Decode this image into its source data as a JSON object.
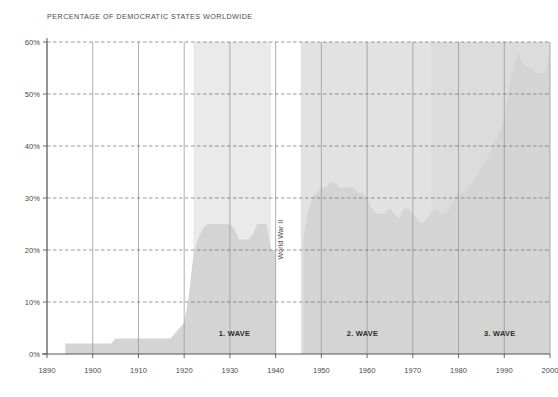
{
  "chart_data": {
    "type": "area",
    "title": "PERCENTAGE OF DEMOCRATIC STATES WORLDWIDE",
    "xlabel": "",
    "ylabel": "",
    "xlim": [
      1890,
      2000
    ],
    "ylim": [
      0,
      60
    ],
    "grid": true,
    "legend": "none",
    "y_ticks": [
      "0%",
      "10%",
      "20%",
      "30%",
      "40%",
      "50%",
      "60%"
    ],
    "y_tick_values": [
      0,
      10,
      20,
      30,
      40,
      50,
      60
    ],
    "x_ticks": [
      "1890",
      "1900",
      "1910",
      "1920",
      "1930",
      "1940",
      "1950",
      "1960",
      "1970",
      "1980",
      "1990",
      "2000"
    ],
    "x_tick_values": [
      1890,
      1900,
      1910,
      1920,
      1930,
      1940,
      1950,
      1960,
      1970,
      1980,
      1990,
      2000
    ],
    "series": [
      {
        "name": "Percentage of democratic states worldwide",
        "fill_color": "#d4d4d4",
        "x": [
          1890,
          1893,
          1894,
          1899,
          1900,
          1904,
          1905,
          1909,
          1910,
          1914,
          1915,
          1917,
          1918,
          1919,
          1920,
          1921,
          1922,
          1923,
          1924,
          1925,
          1926,
          1927,
          1928,
          1929,
          1930,
          1931,
          1932,
          1933,
          1934,
          1935,
          1936,
          1937,
          1938,
          1939,
          1940,
          1941,
          1942,
          1943,
          1944,
          1945,
          1946,
          1947,
          1948,
          1949,
          1950,
          1951,
          1952,
          1953,
          1954,
          1955,
          1956,
          1957,
          1958,
          1959,
          1960,
          1961,
          1962,
          1963,
          1964,
          1965,
          1966,
          1967,
          1968,
          1969,
          1970,
          1971,
          1972,
          1973,
          1974,
          1975,
          1976,
          1977,
          1978,
          1979,
          1980,
          1981,
          1982,
          1983,
          1984,
          1985,
          1986,
          1987,
          1988,
          1989,
          1990,
          1991,
          1992,
          1993,
          1994,
          1995,
          1996,
          1997,
          1998,
          1999,
          2000
        ],
        "y": [
          0,
          0,
          2,
          2,
          2,
          2,
          3,
          3,
          3,
          3,
          3,
          3,
          4,
          5,
          6,
          11,
          19,
          22,
          24,
          25,
          25,
          25,
          25,
          25,
          25,
          24,
          22,
          22,
          22,
          23,
          25,
          25,
          25,
          20,
          20,
          0,
          0,
          0,
          0,
          0,
          22,
          27,
          30,
          31,
          32,
          32,
          33,
          33,
          32,
          32,
          32,
          32,
          31,
          31,
          30,
          28,
          27,
          27,
          27,
          28,
          27,
          26,
          28,
          28,
          27,
          26,
          25,
          26,
          27,
          28,
          27,
          27,
          28,
          30,
          31,
          31,
          32,
          33,
          34,
          36,
          37,
          39,
          41,
          43,
          45,
          51,
          55,
          58,
          56,
          55,
          55,
          54,
          54,
          54,
          58
        ],
        "note": "Values below 20% between 1940-1945 not plotted; area drops to zero during World War II gap"
      }
    ],
    "annotations": [
      {
        "text": "1. WAVE",
        "x_start": 1922,
        "x_end": 1942,
        "label_x": 1931,
        "label_y": 3.5
      },
      {
        "text": "World War II",
        "x_start": 1939,
        "x_end": 1945,
        "label_x": 1941.6,
        "label_y": 22,
        "rotation": -90
      },
      {
        "text": "2. WAVE",
        "x_start": 1946,
        "x_end": 1974,
        "label_x": 1959,
        "label_y": 3.5
      },
      {
        "text": "3. WAVE",
        "x_start": 1974,
        "x_end": 2000,
        "label_x": 1989,
        "label_y": 3.5
      }
    ],
    "bands": [
      {
        "name": "1. WAVE",
        "x_start": 1922,
        "x_end": 1939,
        "color": "#eaeaea"
      },
      {
        "name": "World War II",
        "x_start": 1939,
        "x_end": 1945.5,
        "color": "#ffffff"
      },
      {
        "name": "2. WAVE",
        "x_start": 1945.5,
        "x_end": 1974,
        "color": "#e2e2e2"
      },
      {
        "name": "3. WAVE",
        "x_start": 1974,
        "x_end": 2000,
        "color": "#dcdcdc"
      }
    ],
    "colors": {
      "area_fill": "#d4d4d4",
      "band_wave1": "#eaeaea",
      "band_ww2": "#ffffff",
      "band_wave2": "#e2e2e2",
      "band_wave3": "#dcdcdc",
      "gridline": "#999999",
      "axis": "#555555",
      "text": "#4a4a4a",
      "background": "#ffffff"
    }
  }
}
